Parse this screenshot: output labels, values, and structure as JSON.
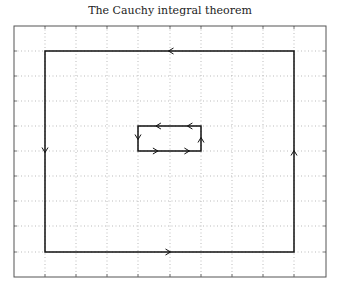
{
  "title": "The Cauchy integral theorem",
  "plot": {
    "frame": {
      "x0": 14,
      "y0": 26,
      "x1": 326,
      "y1": 277
    },
    "grid": {
      "x": [
        45,
        76,
        107,
        138,
        170,
        201,
        232,
        263,
        294
      ],
      "y": [
        51,
        76,
        101,
        126,
        151,
        176,
        201,
        226,
        252
      ]
    },
    "outer_contour": {
      "x0": 45,
      "y0": 51,
      "x1": 294,
      "y1": 252,
      "orientation": "counterclockwise"
    },
    "inner_contour": {
      "x0": 138,
      "y0": 126,
      "x1": 201,
      "y1": 151,
      "orientation": "clockwise"
    },
    "colors": {
      "contour": "#111111",
      "grid": "#aaaaaa",
      "frame": "#555555"
    }
  }
}
